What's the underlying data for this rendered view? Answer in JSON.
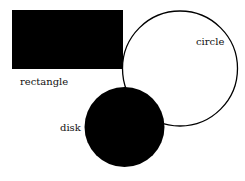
{
  "diagram": {
    "shapes": [
      {
        "id": "rectangle",
        "label": "rectangle",
        "fill": "#000000"
      },
      {
        "id": "circle",
        "label": "circle",
        "fill": "#ffffff",
        "stroke": "#000000"
      },
      {
        "id": "disk",
        "label": "disk",
        "fill": "#000000"
      }
    ]
  }
}
